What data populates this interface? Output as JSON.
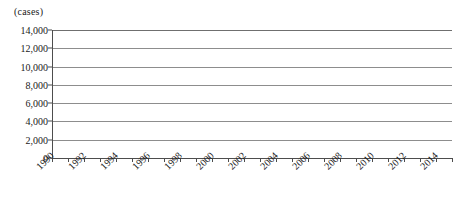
{
  "chart_data": {
    "type": "line",
    "title": "",
    "subtitle": "",
    "xlabel": "",
    "ylabel": "(cases)",
    "unit_label": "(cases)",
    "grid": "horizontal",
    "legend": "none",
    "marker": "diamond",
    "series_color": "#7d7d7d",
    "line_color": "#9a9a9a",
    "ylim": [
      0,
      14000
    ],
    "ytick_labels": [
      "14,000",
      "12,000",
      "10,000",
      "8,000",
      "6,000",
      "4,000",
      "2,000",
      "0"
    ],
    "ytick_values": [
      14000,
      12000,
      10000,
      8000,
      6000,
      4000,
      2000,
      0
    ],
    "xlim": [
      1990,
      2015
    ],
    "xtick_values": [
      1990,
      1991,
      1992,
      1993,
      1994,
      1995,
      1996,
      1997,
      1998,
      1999,
      2000,
      2001,
      2002,
      2003,
      2004,
      2005,
      2006,
      2007,
      2008,
      2009,
      2010,
      2011,
      2012,
      2013,
      2014,
      2015
    ],
    "xtick_labels": [
      "1990",
      "1992",
      "1994",
      "1996",
      "1998",
      "2000",
      "2002",
      "2004",
      "2006",
      "2008",
      "2010",
      "2012",
      "2014"
    ],
    "xtick_label_values": [
      1990,
      1992,
      1994,
      1996,
      1998,
      2000,
      2002,
      2004,
      2006,
      2008,
      2010,
      2012,
      2014
    ],
    "categories": [
      1990,
      1991,
      1992,
      1993,
      1994,
      1995,
      1996,
      1997,
      1998,
      1999,
      2000,
      2001,
      2002,
      2003,
      2004,
      2005,
      2006,
      2007,
      2008,
      2009,
      2010,
      2011,
      2012,
      2013,
      2014
    ],
    "values": [
      500,
      450,
      480,
      460,
      640,
      880,
      1500,
      1400,
      2450,
      4350,
      6950,
      5300,
      7050,
      10350,
      13300,
      10900,
      9400,
      7400,
      8550,
      4650,
      6400,
      6900,
      5400,
      2850,
      2300
    ]
  }
}
